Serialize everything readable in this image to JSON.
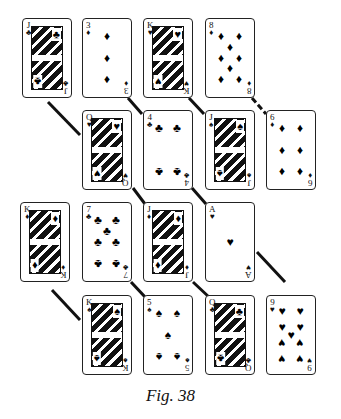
{
  "figure": {
    "caption": "Fig. 38",
    "connector_color": "#111111"
  },
  "cards": [
    {
      "id": "c1",
      "rank": "J",
      "suit": "♣",
      "suit_name": "clubs",
      "row": 1,
      "x": 22,
      "y": 18,
      "court": true
    },
    {
      "id": "c2",
      "rank": "3",
      "suit": "♦",
      "suit_name": "diamonds",
      "row": 1,
      "x": 82,
      "y": 18,
      "court": false
    },
    {
      "id": "c3",
      "rank": "K",
      "suit": "♥",
      "suit_name": "hearts",
      "row": 1,
      "x": 143,
      "y": 18,
      "court": true
    },
    {
      "id": "c4",
      "rank": "8",
      "suit": "♦",
      "suit_name": "diamonds",
      "row": 1,
      "x": 205,
      "y": 18,
      "court": false
    },
    {
      "id": "c5",
      "rank": "Q",
      "suit": "♥",
      "suit_name": "hearts",
      "row": 2,
      "x": 82,
      "y": 110,
      "court": true
    },
    {
      "id": "c6",
      "rank": "4",
      "suit": "♣",
      "suit_name": "clubs",
      "row": 2,
      "x": 143,
      "y": 110,
      "court": false
    },
    {
      "id": "c7",
      "rank": "J",
      "suit": "♠",
      "suit_name": "spades",
      "row": 2,
      "x": 205,
      "y": 110,
      "court": true
    },
    {
      "id": "c8",
      "rank": "6",
      "suit": "♦",
      "suit_name": "diamonds",
      "row": 2,
      "x": 266,
      "y": 110,
      "court": false
    },
    {
      "id": "c9",
      "rank": "K",
      "suit": "♦",
      "suit_name": "diamonds",
      "row": 3,
      "x": 20,
      "y": 202,
      "court": true
    },
    {
      "id": "c10",
      "rank": "7",
      "suit": "♣",
      "suit_name": "clubs",
      "row": 3,
      "x": 82,
      "y": 202,
      "court": false
    },
    {
      "id": "c11",
      "rank": "J",
      "suit": "♦",
      "suit_name": "diamonds",
      "row": 3,
      "x": 143,
      "y": 202,
      "court": true
    },
    {
      "id": "c12",
      "rank": "A",
      "suit": "♥",
      "suit_name": "hearts",
      "row": 3,
      "x": 205,
      "y": 202,
      "court": false
    },
    {
      "id": "c13",
      "rank": "K",
      "suit": "♠",
      "suit_name": "spades",
      "row": 4,
      "x": 82,
      "y": 295,
      "court": true
    },
    {
      "id": "c14",
      "rank": "5",
      "suit": "♠",
      "suit_name": "spades",
      "row": 4,
      "x": 143,
      "y": 295,
      "court": false
    },
    {
      "id": "c15",
      "rank": "Q",
      "suit": "♣",
      "suit_name": "clubs",
      "row": 4,
      "x": 205,
      "y": 295,
      "court": true
    },
    {
      "id": "c16",
      "rank": "9",
      "suit": "♥",
      "suit_name": "hearts",
      "row": 4,
      "x": 266,
      "y": 295,
      "court": false
    }
  ],
  "connectors": [
    {
      "from": "J♣",
      "to": "Q♥",
      "x1": 48,
      "y1": 102,
      "x2": 80,
      "y2": 135
    },
    {
      "from": "3♦",
      "to": "4♣",
      "x1": 128,
      "y1": 98,
      "x2": 142,
      "y2": 114
    },
    {
      "from": "K♥",
      "to": "J♠",
      "x1": 189,
      "y1": 98,
      "x2": 204,
      "y2": 114
    },
    {
      "from": "8♦",
      "to": "6♦",
      "x1": 252,
      "y1": 98,
      "x2": 266,
      "y2": 114,
      "dashed": true
    },
    {
      "from": "Q♥",
      "to": "J♦",
      "x1": 133,
      "y1": 182,
      "x2": 145,
      "y2": 204
    },
    {
      "from": "4♣",
      "to": "A♥",
      "x1": 192,
      "y1": 188,
      "x2": 206,
      "y2": 204
    },
    {
      "from": "K♦",
      "to": "K♠",
      "x1": 52,
      "y1": 290,
      "x2": 80,
      "y2": 320
    },
    {
      "from": "7♣",
      "to": "5♠",
      "x1": 131,
      "y1": 282,
      "x2": 146,
      "y2": 298
    },
    {
      "from": "J♦",
      "to": "Q♣",
      "x1": 193,
      "y1": 282,
      "x2": 212,
      "y2": 298
    },
    {
      "from": "A♥",
      "to": "9♥",
      "x1": 257,
      "y1": 252,
      "x2": 285,
      "y2": 282
    }
  ]
}
